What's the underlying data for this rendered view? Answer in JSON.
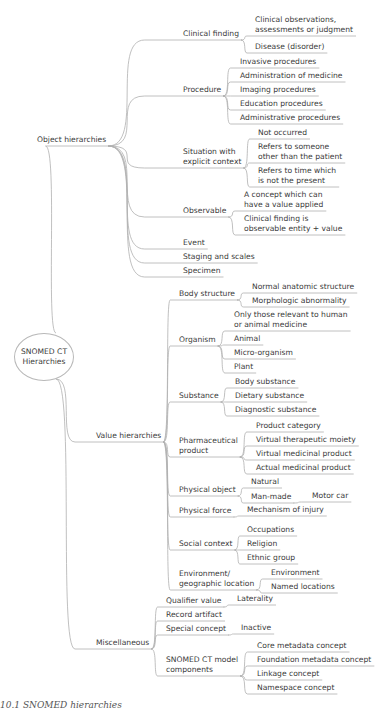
{
  "root": {
    "label_line1": "SNOMED CT",
    "label_line2": "Hierarchies"
  },
  "caption": "10.1 SNOMED hierarchies",
  "line_color": "#b0b0b0",
  "nodes": [
    {
      "id": "obj",
      "text": "Object hierarchies",
      "x": 37,
      "y": 135,
      "parent": "root"
    },
    {
      "id": "cf",
      "text": "Clinical finding",
      "x": 183,
      "y": 29,
      "parent": "obj"
    },
    {
      "id": "cf1",
      "text": "Clinical observations,\nassessments or judgment",
      "x": 255,
      "y": 15,
      "parent": "cf"
    },
    {
      "id": "cf2",
      "text": "Disease (disorder)",
      "x": 255,
      "y": 42,
      "parent": "cf"
    },
    {
      "id": "proc",
      "text": "Procedure",
      "x": 183,
      "y": 85,
      "parent": "obj"
    },
    {
      "id": "p1",
      "text": "Invasive procedures",
      "x": 240,
      "y": 57,
      "parent": "proc"
    },
    {
      "id": "p2",
      "text": "Administration of medicine",
      "x": 240,
      "y": 71,
      "parent": "proc"
    },
    {
      "id": "p3",
      "text": "Imaging procedures",
      "x": 240,
      "y": 85,
      "parent": "proc"
    },
    {
      "id": "p4",
      "text": "Education procedures",
      "x": 240,
      "y": 99,
      "parent": "proc"
    },
    {
      "id": "p5",
      "text": "Administrative procedures",
      "x": 240,
      "y": 113,
      "parent": "proc"
    },
    {
      "id": "sit",
      "text": "Situation with\nexplicit context",
      "x": 183,
      "y": 147,
      "parent": "obj"
    },
    {
      "id": "s1",
      "text": "Not occurred",
      "x": 258,
      "y": 128,
      "parent": "sit"
    },
    {
      "id": "s2",
      "text": "Refers to someone\nother than the patient",
      "x": 258,
      "y": 142,
      "parent": "sit"
    },
    {
      "id": "s3",
      "text": "Refers to time which\nis not the present",
      "x": 258,
      "y": 166,
      "parent": "sit"
    },
    {
      "id": "obs",
      "text": "Observable",
      "x": 183,
      "y": 206,
      "parent": "obj"
    },
    {
      "id": "o1",
      "text": "A concept which can\nhave a value applied",
      "x": 244,
      "y": 190,
      "parent": "obs"
    },
    {
      "id": "o2",
      "text": "Clinical finding is\nobservable entity + value",
      "x": 244,
      "y": 214,
      "parent": "obs"
    },
    {
      "id": "ev",
      "text": "Event",
      "x": 183,
      "y": 238,
      "parent": "obj"
    },
    {
      "id": "stg",
      "text": "Staging and scales",
      "x": 183,
      "y": 252,
      "parent": "obj"
    },
    {
      "id": "spc",
      "text": "Specimen",
      "x": 183,
      "y": 266,
      "parent": "obj"
    },
    {
      "id": "val",
      "text": "Value hierarchies",
      "x": 96,
      "y": 431,
      "parent": "root"
    },
    {
      "id": "bs",
      "text": "Body structure",
      "x": 179,
      "y": 289,
      "parent": "val"
    },
    {
      "id": "b1",
      "text": "Normal anatomic structure",
      "x": 252,
      "y": 282,
      "parent": "bs"
    },
    {
      "id": "b2",
      "text": "Morphologic abnormality",
      "x": 252,
      "y": 296,
      "parent": "bs"
    },
    {
      "id": "org",
      "text": "Organism",
      "x": 179,
      "y": 335,
      "parent": "val"
    },
    {
      "id": "g1",
      "text": "Only those relevant to human\nor animal medicine",
      "x": 234,
      "y": 310,
      "parent": "org"
    },
    {
      "id": "g2",
      "text": "Animal",
      "x": 234,
      "y": 334,
      "parent": "org"
    },
    {
      "id": "g3",
      "text": "Micro-organism",
      "x": 234,
      "y": 348,
      "parent": "org"
    },
    {
      "id": "g4",
      "text": "Plant",
      "x": 234,
      "y": 362,
      "parent": "org"
    },
    {
      "id": "sub",
      "text": "Substance",
      "x": 179,
      "y": 391,
      "parent": "val"
    },
    {
      "id": "u1",
      "text": "Body substance",
      "x": 235,
      "y": 377,
      "parent": "sub"
    },
    {
      "id": "u2",
      "text": "Dietary substance",
      "x": 235,
      "y": 391,
      "parent": "sub"
    },
    {
      "id": "u3",
      "text": "Diagnostic substance",
      "x": 235,
      "y": 405,
      "parent": "sub"
    },
    {
      "id": "ph",
      "text": "Pharmaceutical\nproduct",
      "x": 179,
      "y": 436,
      "parent": "val"
    },
    {
      "id": "h1",
      "text": "Product category",
      "x": 256,
      "y": 421,
      "parent": "ph"
    },
    {
      "id": "h2",
      "text": "Virtual therapeutic moiety",
      "x": 256,
      "y": 435,
      "parent": "ph"
    },
    {
      "id": "h3",
      "text": "Virtual medicinal product",
      "x": 256,
      "y": 449,
      "parent": "ph"
    },
    {
      "id": "h4",
      "text": "Actual medicinal product",
      "x": 256,
      "y": 463,
      "parent": "ph"
    },
    {
      "id": "po",
      "text": "Physical object",
      "x": 179,
      "y": 485,
      "parent": "val"
    },
    {
      "id": "n1",
      "text": "Natural",
      "x": 251,
      "y": 477,
      "parent": "po"
    },
    {
      "id": "n2",
      "text": "Man-made",
      "x": 251,
      "y": 492,
      "parent": "po"
    },
    {
      "id": "n3",
      "text": "Motor car",
      "x": 312,
      "y": 491,
      "parent": "n2"
    },
    {
      "id": "pf",
      "text": "Physical force",
      "x": 179,
      "y": 506,
      "parent": "val"
    },
    {
      "id": "f1",
      "text": "Mechanism of injury",
      "x": 247,
      "y": 505,
      "parent": "pf"
    },
    {
      "id": "sc",
      "text": "Social context",
      "x": 179,
      "y": 539,
      "parent": "val"
    },
    {
      "id": "c1",
      "text": "Occupations",
      "x": 247,
      "y": 525,
      "parent": "sc"
    },
    {
      "id": "c2",
      "text": "Religion",
      "x": 247,
      "y": 539,
      "parent": "sc"
    },
    {
      "id": "c3",
      "text": "Ethnic group",
      "x": 247,
      "y": 553,
      "parent": "sc"
    },
    {
      "id": "env",
      "text": "Environment/\ngeographic location",
      "x": 179,
      "y": 569,
      "parent": "val"
    },
    {
      "id": "e1",
      "text": "Environment",
      "x": 271,
      "y": 568,
      "parent": "env"
    },
    {
      "id": "e2",
      "text": "Named locations",
      "x": 271,
      "y": 582,
      "parent": "env"
    },
    {
      "id": "misc",
      "text": "Miscellaneous",
      "x": 96,
      "y": 638,
      "parent": "root"
    },
    {
      "id": "qv",
      "text": "Qualifier value",
      "x": 166,
      "y": 596,
      "parent": "misc"
    },
    {
      "id": "q1",
      "text": "Laterality",
      "x": 237,
      "y": 594,
      "parent": "qv"
    },
    {
      "id": "ra",
      "text": "Record artifact",
      "x": 166,
      "y": 610,
      "parent": "misc"
    },
    {
      "id": "spx",
      "text": "Special concept",
      "x": 166,
      "y": 624,
      "parent": "misc"
    },
    {
      "id": "x1",
      "text": "Inactive",
      "x": 241,
      "y": 623,
      "parent": "spx"
    },
    {
      "id": "mdl",
      "text": "SNOMED CT model\ncomponents",
      "x": 166,
      "y": 655,
      "parent": "misc"
    },
    {
      "id": "m1",
      "text": "Core metadata concept",
      "x": 257,
      "y": 641,
      "parent": "mdl"
    },
    {
      "id": "m2",
      "text": "Foundation metadata concept",
      "x": 257,
      "y": 655,
      "parent": "mdl"
    },
    {
      "id": "m3",
      "text": "Linkage concept",
      "x": 257,
      "y": 669,
      "parent": "mdl"
    },
    {
      "id": "m4",
      "text": "Namespace concept",
      "x": 257,
      "y": 683,
      "parent": "mdl"
    }
  ]
}
